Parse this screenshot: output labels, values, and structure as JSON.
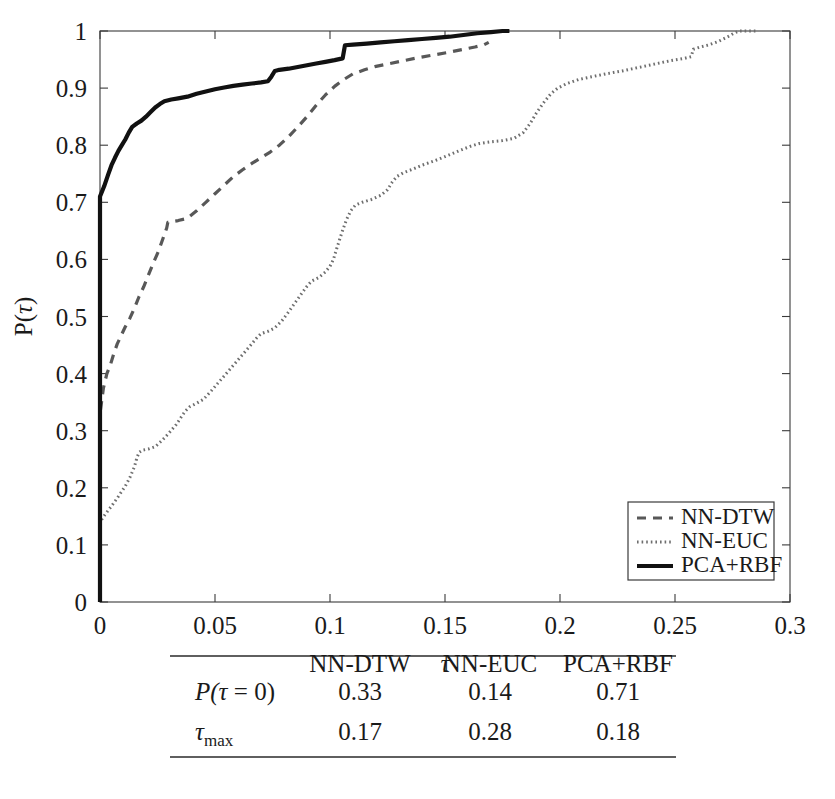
{
  "figure": {
    "background": "#ffffff",
    "ink": "#1a1a1a"
  },
  "chart_data": {
    "type": "line",
    "title": "",
    "xlabel": "τ",
    "ylabel": "P(τ)",
    "xlim": [
      0,
      0.3
    ],
    "ylim": [
      0,
      1
    ],
    "xticks": [
      0,
      0.05,
      0.1,
      0.15,
      0.2,
      0.25,
      0.3
    ],
    "xtick_labels": [
      "0",
      "0.05",
      "0.1",
      "0.15",
      "0.2",
      "0.25",
      "0.3"
    ],
    "yticks": [
      0,
      0.1,
      0.2,
      0.3,
      0.4,
      0.5,
      0.6,
      0.7,
      0.8,
      0.9,
      1
    ],
    "ytick_labels": [
      "0",
      "0.1",
      "0.2",
      "0.3",
      "0.4",
      "0.5",
      "0.6",
      "0.7",
      "0.8",
      "0.9",
      "1"
    ],
    "grid": false,
    "legend_position": "lower right",
    "series": [
      {
        "name": "NN-DTW",
        "style": "dashed",
        "color": "#585858",
        "width": 3.2,
        "dasharray": "9,7",
        "points": [
          [
            0.0,
            0.0
          ],
          [
            0.0,
            0.33
          ],
          [
            0.0015,
            0.375
          ],
          [
            0.003,
            0.4
          ],
          [
            0.0045,
            0.415
          ],
          [
            0.006,
            0.435
          ],
          [
            0.0075,
            0.452
          ],
          [
            0.009,
            0.465
          ],
          [
            0.011,
            0.482
          ],
          [
            0.013,
            0.497
          ],
          [
            0.015,
            0.515
          ],
          [
            0.017,
            0.535
          ],
          [
            0.019,
            0.552
          ],
          [
            0.021,
            0.572
          ],
          [
            0.023,
            0.592
          ],
          [
            0.0255,
            0.615
          ],
          [
            0.0275,
            0.638
          ],
          [
            0.029,
            0.655
          ],
          [
            0.0295,
            0.665
          ],
          [
            0.031,
            0.666
          ],
          [
            0.034,
            0.668
          ],
          [
            0.038,
            0.672
          ],
          [
            0.042,
            0.685
          ],
          [
            0.046,
            0.7
          ],
          [
            0.05,
            0.715
          ],
          [
            0.054,
            0.73
          ],
          [
            0.058,
            0.745
          ],
          [
            0.062,
            0.757
          ],
          [
            0.066,
            0.768
          ],
          [
            0.07,
            0.778
          ],
          [
            0.074,
            0.788
          ],
          [
            0.078,
            0.8
          ],
          [
            0.082,
            0.815
          ],
          [
            0.086,
            0.832
          ],
          [
            0.09,
            0.85
          ],
          [
            0.094,
            0.87
          ],
          [
            0.098,
            0.888
          ],
          [
            0.102,
            0.903
          ],
          [
            0.106,
            0.915
          ],
          [
            0.11,
            0.925
          ],
          [
            0.115,
            0.932
          ],
          [
            0.12,
            0.938
          ],
          [
            0.126,
            0.943
          ],
          [
            0.132,
            0.948
          ],
          [
            0.138,
            0.953
          ],
          [
            0.145,
            0.958
          ],
          [
            0.152,
            0.963
          ],
          [
            0.158,
            0.968
          ],
          [
            0.163,
            0.972
          ],
          [
            0.167,
            0.976
          ],
          [
            0.169,
            0.98
          ]
        ]
      },
      {
        "name": "NN-EUC",
        "style": "dotted",
        "color": "#6e6e6e",
        "width": 3.0,
        "dasharray": "1.6,3.0",
        "points": [
          [
            0.0,
            0.0
          ],
          [
            0.0,
            0.14
          ],
          [
            0.002,
            0.152
          ],
          [
            0.005,
            0.168
          ],
          [
            0.008,
            0.185
          ],
          [
            0.011,
            0.203
          ],
          [
            0.013,
            0.218
          ],
          [
            0.015,
            0.237
          ],
          [
            0.016,
            0.252
          ],
          [
            0.017,
            0.262
          ],
          [
            0.0185,
            0.266
          ],
          [
            0.021,
            0.268
          ],
          [
            0.024,
            0.272
          ],
          [
            0.027,
            0.283
          ],
          [
            0.03,
            0.296
          ],
          [
            0.033,
            0.31
          ],
          [
            0.035,
            0.322
          ],
          [
            0.037,
            0.334
          ],
          [
            0.039,
            0.342
          ],
          [
            0.042,
            0.348
          ],
          [
            0.045,
            0.355
          ],
          [
            0.048,
            0.368
          ],
          [
            0.051,
            0.382
          ],
          [
            0.054,
            0.396
          ],
          [
            0.057,
            0.41
          ],
          [
            0.06,
            0.424
          ],
          [
            0.063,
            0.438
          ],
          [
            0.066,
            0.452
          ],
          [
            0.068,
            0.462
          ],
          [
            0.07,
            0.47
          ],
          [
            0.073,
            0.474
          ],
          [
            0.076,
            0.48
          ],
          [
            0.079,
            0.492
          ],
          [
            0.082,
            0.508
          ],
          [
            0.085,
            0.525
          ],
          [
            0.088,
            0.542
          ],
          [
            0.09,
            0.553
          ],
          [
            0.092,
            0.562
          ],
          [
            0.095,
            0.568
          ],
          [
            0.098,
            0.578
          ],
          [
            0.1,
            0.588
          ],
          [
            0.1015,
            0.6
          ],
          [
            0.103,
            0.62
          ],
          [
            0.105,
            0.645
          ],
          [
            0.107,
            0.668
          ],
          [
            0.109,
            0.685
          ],
          [
            0.111,
            0.695
          ],
          [
            0.114,
            0.7
          ],
          [
            0.118,
            0.705
          ],
          [
            0.122,
            0.712
          ],
          [
            0.125,
            0.722
          ],
          [
            0.127,
            0.735
          ],
          [
            0.129,
            0.745
          ],
          [
            0.132,
            0.752
          ],
          [
            0.136,
            0.758
          ],
          [
            0.14,
            0.765
          ],
          [
            0.145,
            0.772
          ],
          [
            0.15,
            0.78
          ],
          [
            0.156,
            0.79
          ],
          [
            0.161,
            0.798
          ],
          [
            0.165,
            0.803
          ],
          [
            0.17,
            0.806
          ],
          [
            0.175,
            0.808
          ],
          [
            0.18,
            0.812
          ],
          [
            0.184,
            0.822
          ],
          [
            0.187,
            0.838
          ],
          [
            0.19,
            0.858
          ],
          [
            0.193,
            0.875
          ],
          [
            0.196,
            0.89
          ],
          [
            0.199,
            0.9
          ],
          [
            0.203,
            0.908
          ],
          [
            0.208,
            0.915
          ],
          [
            0.214,
            0.92
          ],
          [
            0.22,
            0.925
          ],
          [
            0.227,
            0.93
          ],
          [
            0.234,
            0.936
          ],
          [
            0.241,
            0.942
          ],
          [
            0.248,
            0.948
          ],
          [
            0.254,
            0.952
          ],
          [
            0.257,
            0.955
          ],
          [
            0.258,
            0.968
          ],
          [
            0.261,
            0.972
          ],
          [
            0.265,
            0.976
          ],
          [
            0.269,
            0.982
          ],
          [
            0.273,
            0.99
          ],
          [
            0.276,
            0.997
          ],
          [
            0.278,
            1.0
          ],
          [
            0.285,
            1.0
          ]
        ]
      },
      {
        "name": "PCA+RBF",
        "style": "solid",
        "color": "#111111",
        "width": 4.2,
        "dasharray": "",
        "points": [
          [
            0.0,
            0.0
          ],
          [
            0.0,
            0.71
          ],
          [
            0.0018,
            0.728
          ],
          [
            0.0035,
            0.748
          ],
          [
            0.005,
            0.765
          ],
          [
            0.0065,
            0.778
          ],
          [
            0.008,
            0.79
          ],
          [
            0.0095,
            0.8
          ],
          [
            0.011,
            0.81
          ],
          [
            0.0125,
            0.822
          ],
          [
            0.014,
            0.832
          ],
          [
            0.016,
            0.838
          ],
          [
            0.018,
            0.843
          ],
          [
            0.02,
            0.85
          ],
          [
            0.022,
            0.858
          ],
          [
            0.024,
            0.866
          ],
          [
            0.026,
            0.872
          ],
          [
            0.028,
            0.877
          ],
          [
            0.031,
            0.88
          ],
          [
            0.034,
            0.882
          ],
          [
            0.038,
            0.885
          ],
          [
            0.042,
            0.89
          ],
          [
            0.046,
            0.894
          ],
          [
            0.05,
            0.898
          ],
          [
            0.054,
            0.901
          ],
          [
            0.058,
            0.904
          ],
          [
            0.062,
            0.906
          ],
          [
            0.066,
            0.908
          ],
          [
            0.07,
            0.91
          ],
          [
            0.073,
            0.912
          ],
          [
            0.0745,
            0.92
          ],
          [
            0.076,
            0.93
          ],
          [
            0.078,
            0.932
          ],
          [
            0.082,
            0.934
          ],
          [
            0.086,
            0.937
          ],
          [
            0.09,
            0.94
          ],
          [
            0.094,
            0.943
          ],
          [
            0.098,
            0.946
          ],
          [
            0.102,
            0.949
          ],
          [
            0.1055,
            0.952
          ],
          [
            0.1065,
            0.975
          ],
          [
            0.11,
            0.976
          ],
          [
            0.116,
            0.978
          ],
          [
            0.122,
            0.98
          ],
          [
            0.128,
            0.982
          ],
          [
            0.134,
            0.984
          ],
          [
            0.14,
            0.986
          ],
          [
            0.146,
            0.988
          ],
          [
            0.152,
            0.99
          ],
          [
            0.158,
            0.993
          ],
          [
            0.164,
            0.996
          ],
          [
            0.17,
            0.998
          ],
          [
            0.175,
            1.0
          ],
          [
            0.178,
            1.0
          ]
        ]
      }
    ]
  },
  "legend": {
    "entries": [
      {
        "label": "NN-DTW",
        "style": "dashed"
      },
      {
        "label": "NN-EUC",
        "style": "dotted"
      },
      {
        "label": "PCA+RBF",
        "style": "solid"
      }
    ]
  },
  "table": {
    "columns": [
      "",
      "NN-DTW",
      "NN-EUC",
      "PCA+RBF"
    ],
    "rows": [
      {
        "label": "P(τ = 0)",
        "values": [
          "0.33",
          "0.14",
          "0.71"
        ]
      },
      {
        "label": "τmax",
        "values": [
          "0.17",
          "0.28",
          "0.18"
        ]
      }
    ]
  }
}
